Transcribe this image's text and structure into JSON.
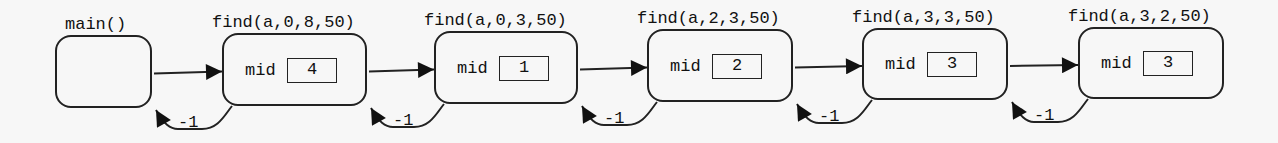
{
  "diagram": {
    "type": "recursion-call-stack",
    "colors": {
      "stroke": "#222222",
      "background": "#f7f7f7",
      "text": "#111111"
    },
    "frames": [
      {
        "id": "main",
        "title": "main()",
        "var_label": "",
        "var_value": "",
        "box": {
          "x": 55,
          "y": 35,
          "w": 97,
          "h": 73
        }
      },
      {
        "id": "f1",
        "title": "find(a,0,8,50)",
        "var_label": "mid",
        "var_value": "4",
        "box": {
          "x": 222,
          "y": 33,
          "w": 145,
          "h": 73
        }
      },
      {
        "id": "f2",
        "title": "find(a,0,3,50)",
        "var_label": "mid",
        "var_value": "1",
        "box": {
          "x": 434,
          "y": 31,
          "w": 144,
          "h": 73
        }
      },
      {
        "id": "f3",
        "title": "find(a,2,3,50)",
        "var_label": "mid",
        "var_value": "2",
        "box": {
          "x": 647,
          "y": 29,
          "w": 146,
          "h": 73
        }
      },
      {
        "id": "f4",
        "title": "find(a,3,3,50)",
        "var_label": "mid",
        "var_value": "3",
        "box": {
          "x": 862,
          "y": 28,
          "w": 146,
          "h": 72
        }
      },
      {
        "id": "f5",
        "title": "find(a,3,2,50)",
        "var_label": "mid",
        "var_value": "3",
        "box": {
          "x": 1078,
          "y": 27,
          "w": 146,
          "h": 72
        }
      }
    ],
    "returns": [
      {
        "from": "f1",
        "to": "main",
        "label": "-1"
      },
      {
        "from": "f2",
        "to": "f1",
        "label": "-1"
      },
      {
        "from": "f3",
        "to": "f2",
        "label": "-1"
      },
      {
        "from": "f4",
        "to": "f3",
        "label": "-1"
      },
      {
        "from": "f5",
        "to": "f4",
        "label": "-1"
      }
    ]
  }
}
